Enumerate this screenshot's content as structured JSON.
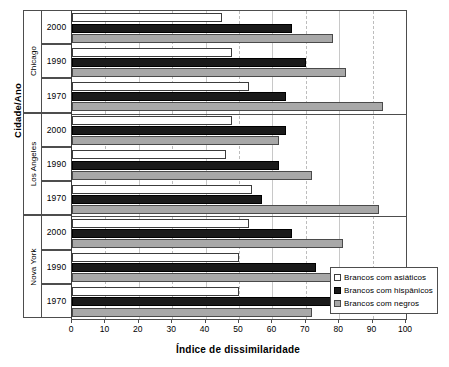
{
  "chart_data": {
    "type": "bar",
    "orientation": "horizontal",
    "title": "",
    "xlabel": "Índice de dissimilaridade",
    "ylabel": "Cidade/Ano",
    "xlim": [
      0,
      100
    ],
    "xticks": [
      0,
      10,
      20,
      30,
      40,
      50,
      60,
      70,
      80,
      90,
      100
    ],
    "grid": true,
    "legend_position": "bottom-right",
    "categories": [
      "Chicago 2000",
      "Chicago 1990",
      "Chicago 1970",
      "Los Angeles 2000",
      "Los Angeles 1990",
      "Los Angeles 1970",
      "Nova York 2000",
      "Nova York 1990",
      "Nova York 1970"
    ],
    "groups": [
      {
        "city": "Chicago",
        "years": [
          {
            "year": "2000",
            "asiaticos": 45,
            "hispanicos": 66,
            "negros": 78
          },
          {
            "year": "1990",
            "asiaticos": 48,
            "hispanicos": 70,
            "negros": 82
          },
          {
            "year": "1970",
            "asiaticos": 53,
            "hispanicos": 64,
            "negros": 93
          }
        ]
      },
      {
        "city": "Los Angeles",
        "years": [
          {
            "year": "2000",
            "asiaticos": 48,
            "hispanicos": 64,
            "negros": 62
          },
          {
            "year": "1990",
            "asiaticos": 46,
            "hispanicos": 62,
            "negros": 72
          },
          {
            "year": "1970",
            "asiaticos": 54,
            "hispanicos": 57,
            "negros": 92
          }
        ]
      },
      {
        "city": "Nova York",
        "years": [
          {
            "year": "2000",
            "asiaticos": 53,
            "hispanicos": 66,
            "negros": 81
          },
          {
            "year": "1990",
            "asiaticos": 50,
            "hispanicos": 73,
            "negros": 80
          },
          {
            "year": "1970",
            "asiaticos": 50,
            "hispanicos": 78,
            "negros": 72
          }
        ]
      }
    ],
    "series": [
      {
        "key": "asiaticos",
        "name": "Brancos com asiáticos",
        "color": "#ffffff",
        "values": [
          45,
          48,
          53,
          48,
          46,
          54,
          53,
          50,
          50
        ]
      },
      {
        "key": "hispanicos",
        "name": "Brancos com hispânicos",
        "color": "#1a1a1a",
        "values": [
          66,
          70,
          64,
          64,
          62,
          57,
          66,
          73,
          78
        ]
      },
      {
        "key": "negros",
        "name": "Brancos com negros",
        "color": "#a8a8a8",
        "values": [
          78,
          82,
          93,
          62,
          72,
          92,
          81,
          80,
          72
        ]
      }
    ]
  },
  "axes": {
    "y_title": "Cidade/Ano",
    "x_title": "Índice de dissimilaridade",
    "x_tick_labels": [
      "0",
      "10",
      "20",
      "30",
      "40",
      "50",
      "60",
      "70",
      "80",
      "90",
      "100"
    ]
  },
  "legend": {
    "entries": [
      {
        "label": "Brancos com asiáticos",
        "swatch": "s-asiaticos"
      },
      {
        "label": "Brancos com hispânicos",
        "swatch": "s-hispanicos"
      },
      {
        "label": "Brancos com negros",
        "swatch": "s-negros"
      }
    ]
  }
}
